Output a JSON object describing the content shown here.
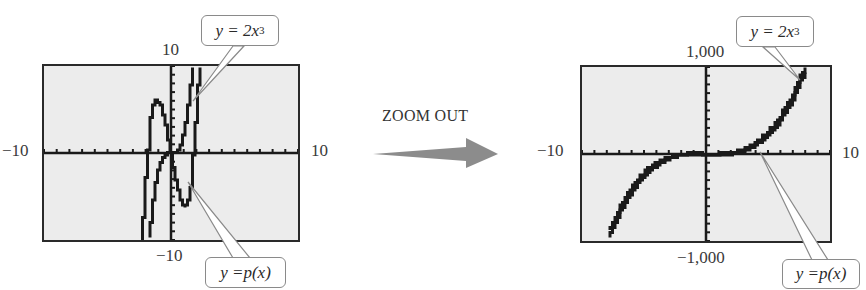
{
  "left_graph": {
    "name": "standard window",
    "window": {
      "xmin": -10,
      "xmax": 10,
      "ymin": -10,
      "ymax": 10
    },
    "labels": {
      "ymax": "10",
      "ymin": "−10",
      "xmin": "−10",
      "xmax": "10"
    },
    "callout_top": {
      "pre": "y = 2x",
      "exp": "3"
    },
    "callout_bottom": {
      "pre": "y = ",
      "fn": "p(x)"
    }
  },
  "right_graph": {
    "name": "zoomed-out window",
    "window": {
      "xmin": -10,
      "xmax": 10,
      "ymin": -1000,
      "ymax": 1000
    },
    "labels": {
      "ymax": "1,000",
      "ymin": "−1,000",
      "xmin": "−10",
      "xmax": "10"
    },
    "callout_top": {
      "pre": "y = 2x",
      "exp": "3"
    },
    "callout_bottom": {
      "pre": "y = ",
      "fn": "p(x)"
    }
  },
  "transition": {
    "label": "ZOOM OUT",
    "arrow_color": "#8c8c8c"
  },
  "colors": {
    "screen_bg": "#ececec",
    "curve": "#1a1a1a",
    "frame": "#2a2a2a",
    "callout_border": "#8a8a8a"
  },
  "chart_data": [
    {
      "type": "line",
      "title": "Graphing calculator view, standard window",
      "xlabel": "",
      "ylabel": "",
      "xlim": [
        -10,
        10
      ],
      "ylim": [
        -10,
        10
      ],
      "grid": false,
      "tick_labels": {
        "x": [
          "−10",
          "10"
        ],
        "y": [
          "−10",
          "10"
        ]
      },
      "series": [
        {
          "name": "y = 2x^3",
          "x": [
            -1.7,
            -1.5,
            -1.2,
            -1.0,
            -0.7,
            -0.4,
            0,
            0.4,
            0.7,
            1.0,
            1.2,
            1.5,
            1.7
          ],
          "y": [
            -9.8,
            -6.75,
            -3.46,
            -2.0,
            -0.69,
            -0.13,
            0,
            0.13,
            0.69,
            2.0,
            3.46,
            6.75,
            9.8
          ]
        },
        {
          "name": "y = p(x)",
          "x": [
            -2.3,
            -2.1,
            -1.9,
            -1.6,
            -1.3,
            -1.1,
            -0.8,
            -0.4,
            0,
            0.4,
            0.8,
            1.1,
            1.3,
            1.6,
            1.9,
            2.1,
            2.3
          ],
          "y": [
            -9.9,
            -6.4,
            -1.8,
            3.7,
            6.0,
            6.2,
            5.4,
            3.1,
            0,
            -3.1,
            -5.4,
            -6.2,
            -6.0,
            -3.7,
            1.8,
            6.4,
            9.9
          ]
        }
      ],
      "annotations": [
        "y = 2x^3",
        "y = p(x)"
      ]
    },
    {
      "type": "line",
      "title": "Graphing calculator view, zoomed out",
      "xlabel": "",
      "ylabel": "",
      "xlim": [
        -10,
        10
      ],
      "ylim": [
        -1000,
        1000
      ],
      "grid": false,
      "tick_labels": {
        "x": [
          "−10",
          "10"
        ],
        "y": [
          "−1,000",
          "1,000"
        ]
      },
      "series": [
        {
          "name": "y = 2x^3",
          "x": [
            -7.8,
            -7,
            -6,
            -5,
            -4,
            -3,
            -2,
            -1,
            0,
            1,
            2,
            3,
            4,
            5,
            6,
            7,
            7.9
          ],
          "y": [
            -949,
            -686,
            -432,
            -250,
            -128,
            -54,
            -16,
            -2,
            0,
            2,
            16,
            54,
            128,
            250,
            432,
            686,
            986
          ]
        },
        {
          "name": "y = p(x)",
          "x": [
            -7.8,
            -7,
            -6,
            -5,
            -4,
            -3,
            -2,
            -1,
            0,
            1,
            2,
            3,
            4,
            5,
            6,
            7,
            7.9
          ],
          "y": [
            -887,
            -630,
            -384,
            -210,
            -96,
            -30,
            0,
            6,
            0,
            -6,
            0,
            30,
            96,
            210,
            384,
            630,
            923
          ]
        }
      ],
      "annotations": [
        "y = 2x^3",
        "y = p(x)"
      ]
    }
  ]
}
